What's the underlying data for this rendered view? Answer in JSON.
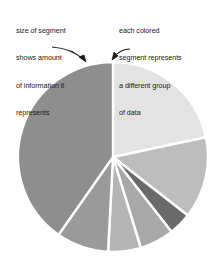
{
  "figure": {
    "type": "pie-chart-diagram",
    "background_color": "#ffffff"
  },
  "annotations": {
    "left": {
      "name": "segment-size-callout",
      "lines": [
        "size of segment",
        "shows amount",
        "of information it",
        "represents"
      ],
      "arrow": {
        "name": "left-callout-arrow",
        "direction": "down-right",
        "points_to": "large-dark-segment"
      }
    },
    "right": {
      "name": "segment-color-callout",
      "lines": [
        "each colored",
        "segment represents",
        "a different group",
        "of data"
      ],
      "arrow": {
        "name": "right-callout-arrow",
        "direction": "down-left",
        "points_to": "large-light-segment"
      }
    }
  },
  "chart_data": {
    "type": "pie",
    "title": "",
    "xlabel": "",
    "ylabel": "",
    "legend": "none",
    "grid": false,
    "center": [
      113,
      157
    ],
    "radius": 95,
    "start_angle_deg": 0,
    "direction": "clockwise",
    "separator_color": "#ffffff",
    "separator_width": 2.4,
    "categories": [
      "segment-1",
      "segment-2",
      "segment-3",
      "segment-4",
      "segment-5",
      "segment-6",
      "segment-7"
    ],
    "values": [
      21.7,
      13.9,
      3.9,
      5.8,
      5.6,
      8.9,
      40.2
    ],
    "angles_deg": [
      78,
      50,
      14,
      21,
      20,
      32,
      145
    ],
    "colors": [
      "#e3e3e3",
      "#bdbdbd",
      "#6a6a6a",
      "#a8a8a8",
      "#b5b5b5",
      "#9a9a9a",
      "#8e8e8e"
    ]
  }
}
